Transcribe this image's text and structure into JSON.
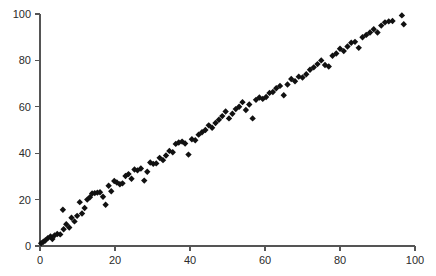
{
  "chart_data": {
    "type": "scatter",
    "title": "",
    "subtitle": "",
    "xlabel": "",
    "ylabel": "",
    "xlim": [
      0,
      100
    ],
    "ylim": [
      0,
      100
    ],
    "grid": false,
    "legend": null,
    "legend_position": "none",
    "marker": {
      "shape": "diamond",
      "color": "#111111",
      "size_px": 3.2
    },
    "axis": {
      "x_ticks": [
        0,
        20,
        40,
        60,
        80,
        100
      ],
      "x_tick_labels": [
        "0",
        "20",
        "40",
        "60",
        "80",
        "100"
      ],
      "y_ticks": [
        0,
        20,
        40,
        60,
        80,
        100
      ],
      "y_tick_labels": [
        "0",
        "20",
        "40",
        "60",
        "80",
        "100"
      ],
      "x_axis_position": "bottom",
      "y_axis_position": "left",
      "tick_direction": "out",
      "spine_color": "#555555"
    },
    "series": [
      {
        "name": "series-1",
        "points": [
          [
            0.3,
            1.2
          ],
          [
            0.9,
            1.8
          ],
          [
            1.4,
            2.4
          ],
          [
            2.1,
            3.4
          ],
          [
            2.8,
            4.1
          ],
          [
            3.3,
            3.0
          ],
          [
            3.9,
            4.6
          ],
          [
            4.6,
            5.2
          ],
          [
            5.4,
            5.0
          ],
          [
            6.1,
            15.6
          ],
          [
            6.3,
            7.2
          ],
          [
            7.0,
            9.4
          ],
          [
            7.8,
            8.0
          ],
          [
            8.4,
            12.2
          ],
          [
            9.2,
            10.6
          ],
          [
            9.9,
            13.0
          ],
          [
            10.6,
            18.9
          ],
          [
            11.2,
            14.0
          ],
          [
            11.9,
            16.4
          ],
          [
            12.6,
            20.0
          ],
          [
            13.3,
            21.0
          ],
          [
            13.9,
            22.6
          ],
          [
            14.6,
            22.8
          ],
          [
            15.3,
            23.0
          ],
          [
            16.0,
            23.2
          ],
          [
            16.8,
            21.2
          ],
          [
            17.5,
            17.8
          ],
          [
            18.3,
            26.0
          ],
          [
            19.0,
            23.6
          ],
          [
            19.8,
            28.0
          ],
          [
            20.5,
            27.4
          ],
          [
            21.3,
            26.6
          ],
          [
            22.0,
            27.0
          ],
          [
            22.8,
            30.2
          ],
          [
            23.6,
            31.0
          ],
          [
            24.4,
            29.0
          ],
          [
            25.2,
            33.0
          ],
          [
            26.0,
            32.6
          ],
          [
            26.9,
            33.4
          ],
          [
            27.8,
            28.2
          ],
          [
            28.6,
            32.0
          ],
          [
            29.4,
            36.0
          ],
          [
            30.2,
            35.4
          ],
          [
            31.0,
            35.6
          ],
          [
            31.9,
            38.0
          ],
          [
            32.8,
            37.0
          ],
          [
            33.6,
            39.0
          ],
          [
            34.5,
            41.0
          ],
          [
            35.4,
            40.4
          ],
          [
            36.2,
            44.0
          ],
          [
            37.0,
            44.6
          ],
          [
            37.9,
            45.0
          ],
          [
            38.7,
            44.2
          ],
          [
            39.6,
            39.4
          ],
          [
            40.5,
            46.0
          ],
          [
            41.4,
            45.6
          ],
          [
            42.3,
            48.0
          ],
          [
            43.2,
            49.0
          ],
          [
            44.1,
            50.0
          ],
          [
            45.0,
            52.0
          ],
          [
            45.9,
            51.0
          ],
          [
            46.8,
            53.0
          ],
          [
            47.7,
            54.4
          ],
          [
            48.6,
            56.0
          ],
          [
            49.5,
            58.0
          ],
          [
            50.4,
            55.0
          ],
          [
            51.3,
            57.0
          ],
          [
            52.2,
            59.0
          ],
          [
            53.1,
            60.0
          ],
          [
            54.0,
            62.0
          ],
          [
            54.9,
            58.6
          ],
          [
            55.8,
            61.0
          ],
          [
            56.7,
            55.0
          ],
          [
            57.6,
            63.0
          ],
          [
            58.5,
            64.0
          ],
          [
            59.4,
            63.4
          ],
          [
            60.3,
            64.2
          ],
          [
            61.2,
            66.0
          ],
          [
            62.1,
            66.4
          ],
          [
            63.0,
            68.0
          ],
          [
            64.0,
            69.0
          ],
          [
            65.0,
            65.0
          ],
          [
            66.0,
            69.6
          ],
          [
            67.0,
            72.0
          ],
          [
            68.0,
            71.0
          ],
          [
            69.0,
            73.0
          ],
          [
            70.0,
            72.6
          ],
          [
            71.0,
            74.0
          ],
          [
            72.0,
            76.0
          ],
          [
            73.0,
            77.0
          ],
          [
            74.0,
            78.4
          ],
          [
            75.0,
            80.0
          ],
          [
            76.0,
            78.0
          ],
          [
            77.0,
            77.4
          ],
          [
            78.0,
            82.0
          ],
          [
            79.0,
            83.0
          ],
          [
            80.0,
            85.0
          ],
          [
            81.0,
            84.0
          ],
          [
            82.0,
            86.0
          ],
          [
            83.0,
            87.6
          ],
          [
            84.0,
            88.0
          ],
          [
            85.0,
            85.4
          ],
          [
            86.0,
            90.0
          ],
          [
            87.0,
            91.0
          ],
          [
            88.0,
            92.0
          ],
          [
            89.0,
            93.4
          ],
          [
            90.0,
            92.0
          ],
          [
            91.0,
            95.0
          ],
          [
            92.0,
            96.4
          ],
          [
            93.0,
            96.8
          ],
          [
            94.0,
            97.0
          ],
          [
            96.5,
            99.4
          ],
          [
            97.0,
            95.6
          ]
        ]
      }
    ]
  },
  "plot_geometry": {
    "x_pixel_at_0": 40,
    "x_pixel_at_100": 415,
    "y_pixel_at_0": 246,
    "y_pixel_at_100": 14
  }
}
